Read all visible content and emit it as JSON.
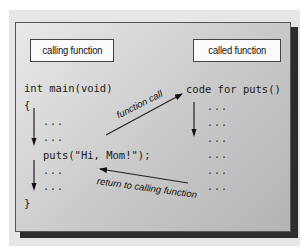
{
  "diagram": {
    "type": "function-call-flow",
    "left_box": {
      "label": "calling function"
    },
    "right_box": {
      "label": "called function"
    },
    "left_code": [
      "int main(void)",
      "{",
      "...",
      "...",
      "puts(\"Hi, Mom!\");",
      "...",
      "...",
      "}"
    ],
    "right_code": {
      "header": "code for puts()",
      "lines": [
        "...",
        "...",
        "...",
        "...",
        "...",
        "..."
      ]
    },
    "arrows": [
      {
        "label": "function call",
        "from": "puts(\"Hi, Mom!\");",
        "to": "code for puts()"
      },
      {
        "label": "return to calling function",
        "from": "called function end",
        "to": "after puts call"
      }
    ],
    "colors": {
      "panel_light": "#e9e9e9",
      "panel_dark": "#b4b4b4",
      "shadow": "#2c2c2c",
      "box_fill": "#fbfbfb",
      "text": "#111111"
    }
  }
}
